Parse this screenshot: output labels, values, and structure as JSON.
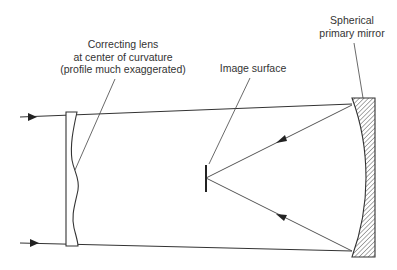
{
  "diagram": {
    "labels": {
      "correcting_lens": [
        "Correcting lens",
        "at center of curvature",
        "(profile much exaggerated)"
      ],
      "image_surface": [
        "Image surface"
      ],
      "primary_mirror": [
        "Spherical",
        "primary mirror"
      ]
    },
    "components": [
      {
        "id": "correcting-lens",
        "type": "aspheric corrector plate"
      },
      {
        "id": "image-surface",
        "type": "curved focal surface"
      },
      {
        "id": "primary-mirror",
        "type": "spherical concave mirror",
        "fill": "hatched"
      }
    ],
    "rays": [
      {
        "id": "incoming-top",
        "direction": "right"
      },
      {
        "id": "incoming-bottom",
        "direction": "right"
      },
      {
        "id": "reflected-top",
        "direction": "to image surface"
      },
      {
        "id": "reflected-bottom",
        "direction": "to image surface"
      }
    ],
    "colors": {
      "line": "#333333",
      "text": "#333333",
      "background": "#ffffff"
    }
  }
}
